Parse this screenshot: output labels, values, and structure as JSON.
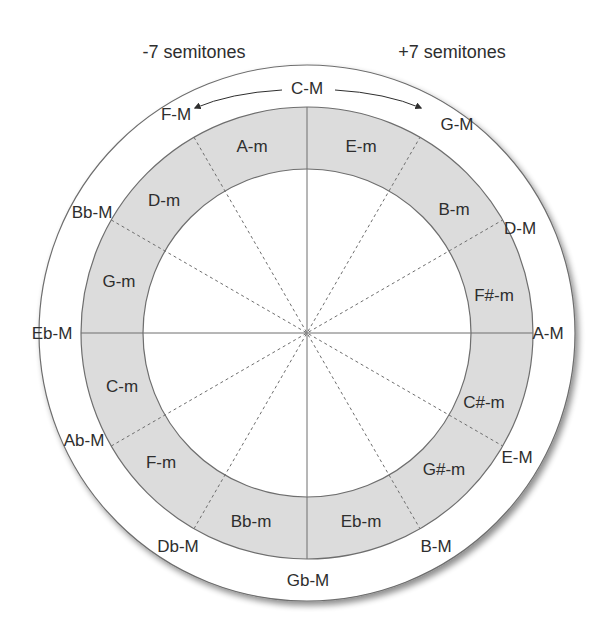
{
  "diagram": {
    "title_left": "-7 semitones",
    "title_right": "+7 semitones",
    "colors": {
      "ring": "#dcdcdc",
      "stroke": "#6e6e6e",
      "text": "#2e2e2e",
      "background": "#ffffff"
    },
    "major_keys": [
      {
        "label": "C-M",
        "x": 307,
        "y": 88
      },
      {
        "label": "G-M",
        "x": 457,
        "y": 124
      },
      {
        "label": "D-M",
        "x": 520,
        "y": 228
      },
      {
        "label": "A-M",
        "x": 548,
        "y": 333
      },
      {
        "label": "E-M",
        "x": 517,
        "y": 457
      },
      {
        "label": "B-M",
        "x": 436,
        "y": 546
      },
      {
        "label": "Gb-M",
        "x": 308,
        "y": 580
      },
      {
        "label": "Db-M",
        "x": 178,
        "y": 546
      },
      {
        "label": "Ab-M",
        "x": 84,
        "y": 440
      },
      {
        "label": "Eb-M",
        "x": 52,
        "y": 333
      },
      {
        "label": "Bb-M",
        "x": 92,
        "y": 212
      },
      {
        "label": "F-M",
        "x": 176,
        "y": 114
      }
    ],
    "minor_keys": [
      {
        "label": "A-m",
        "x": 252,
        "y": 146
      },
      {
        "label": "E-m",
        "x": 361,
        "y": 146
      },
      {
        "label": "B-m",
        "x": 454,
        "y": 209
      },
      {
        "label": "F#-m",
        "x": 494,
        "y": 295
      },
      {
        "label": "C#-m",
        "x": 484,
        "y": 402
      },
      {
        "label": "G#-m",
        "x": 444,
        "y": 469
      },
      {
        "label": "Eb-m",
        "x": 361,
        "y": 521
      },
      {
        "label": "Bb-m",
        "x": 251,
        "y": 521
      },
      {
        "label": "F-m",
        "x": 161,
        "y": 462
      },
      {
        "label": "C-m",
        "x": 122,
        "y": 386
      },
      {
        "label": "G-m",
        "x": 119,
        "y": 281
      },
      {
        "label": "D-m",
        "x": 164,
        "y": 200
      }
    ]
  }
}
